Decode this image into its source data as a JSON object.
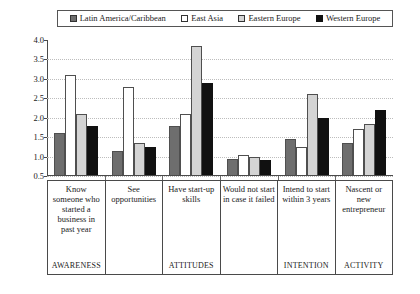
{
  "legend": {
    "items": [
      {
        "label": "Latin America/Caribbean",
        "color": "#6e6e6e",
        "swatch": "filled-dark-gray-swatch"
      },
      {
        "label": "East Asia",
        "color": "#ffffff",
        "swatch": "empty-white-swatch"
      },
      {
        "label": "Eastern Europe",
        "color": "#d4d4d4",
        "swatch": "filled-light-gray-swatch"
      },
      {
        "label": "Western Europe",
        "color": "#111111",
        "swatch": "filled-black-swatch"
      }
    ]
  },
  "axis": {
    "y_ticks": [
      "4.0",
      "3.5",
      "3.0",
      "2.5",
      "2.0",
      "1.5",
      "1.0",
      "0.5"
    ],
    "ymin": 0.5,
    "ymax": 4.0
  },
  "categories": [
    {
      "label": "Know someone who started a business in past year",
      "phase": "AWARENESS"
    },
    {
      "label": "See opportunities",
      "phase": ""
    },
    {
      "label": "Have start-up skills",
      "phase": "ATTITUDES"
    },
    {
      "label": "Would not start in case it failed",
      "phase": ""
    },
    {
      "label": "Intend to start within 3 years",
      "phase": "INTENTION"
    },
    {
      "label": "Nascent or new entrepreneur",
      "phase": "ACTIVITY"
    }
  ],
  "chart_data": {
    "type": "bar",
    "title": "",
    "xlabel": "",
    "ylabel": "",
    "ylim": [
      0.5,
      4.0
    ],
    "grid": true,
    "legend_position": "top",
    "categories": [
      "Know someone who started a business in past year",
      "See opportunities",
      "Have start-up skills",
      "Would not start in case it failed",
      "Intend to start within 3 years",
      "Nascent or new entrepreneur"
    ],
    "series": [
      {
        "name": "Latin America/Caribbean",
        "color": "#6e6e6e",
        "values": [
          1.6,
          1.15,
          1.8,
          0.95,
          1.45,
          1.35
        ]
      },
      {
        "name": "East Asia",
        "color": "#ffffff",
        "values": [
          3.1,
          2.8,
          2.1,
          1.05,
          1.25,
          1.7
        ]
      },
      {
        "name": "Eastern Europe",
        "color": "#d4d4d4",
        "values": [
          2.1,
          1.35,
          3.85,
          1.0,
          2.6,
          1.85
        ]
      },
      {
        "name": "Western Europe",
        "color": "#111111",
        "values": [
          1.8,
          1.25,
          2.9,
          0.9,
          2.0,
          2.2
        ]
      }
    ]
  }
}
